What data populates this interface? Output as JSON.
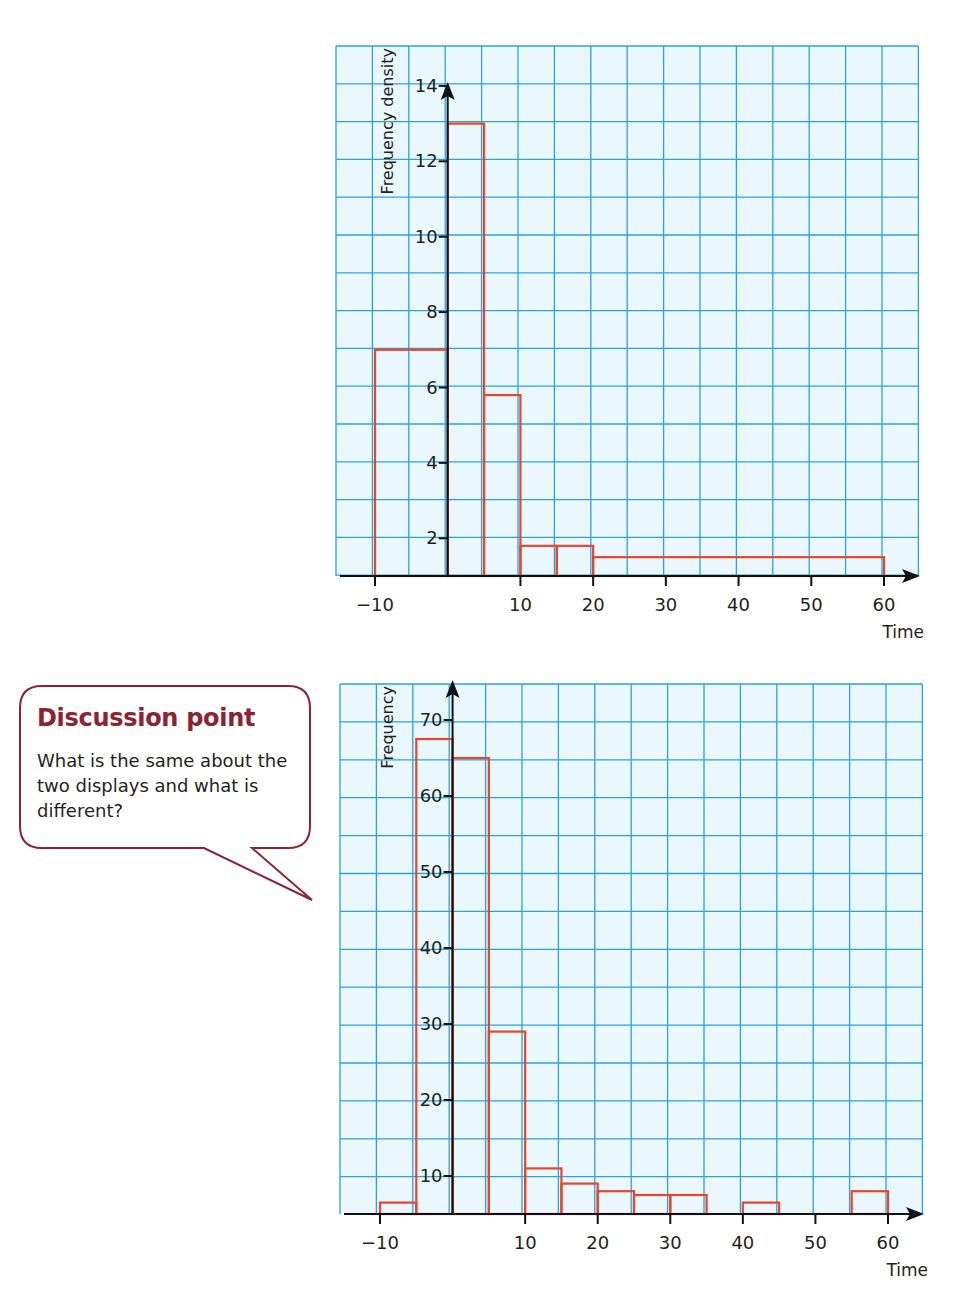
{
  "chart_data": [
    {
      "type": "bar",
      "subtype": "histogram",
      "title": "",
      "xlabel": "Time",
      "ylabel": "Frequency density",
      "xlim": [
        -13,
        64
      ],
      "ylim": [
        1,
        14.5
      ],
      "xticks": [
        -10,
        10,
        20,
        30,
        40,
        50,
        60
      ],
      "yticks": [
        2,
        4,
        6,
        8,
        10,
        12,
        14
      ],
      "grid": true,
      "bins": [
        {
          "from": -10,
          "to": 0,
          "value": 7
        },
        {
          "from": 0,
          "to": 5,
          "value": 13
        },
        {
          "from": 5,
          "to": 10,
          "value": 5.8
        },
        {
          "from": 10,
          "to": 15,
          "value": 1.8
        },
        {
          "from": 15,
          "to": 20,
          "value": 1.8
        },
        {
          "from": 20,
          "to": 60,
          "value": 1.5
        }
      ]
    },
    {
      "type": "bar",
      "subtype": "frequency-chart",
      "title": "",
      "xlabel": "Time",
      "ylabel": "Frequency",
      "xlim": [
        -13,
        64
      ],
      "ylim": [
        5,
        76
      ],
      "xticks": [
        -10,
        10,
        20,
        30,
        40,
        50,
        60
      ],
      "yticks": [
        10,
        20,
        30,
        40,
        50,
        60,
        70
      ],
      "grid": true,
      "bins": [
        {
          "from": -10,
          "to": -5,
          "value": 6.5
        },
        {
          "from": -5,
          "to": 0,
          "value": 67.5
        },
        {
          "from": 0,
          "to": 5,
          "value": 65
        },
        {
          "from": 5,
          "to": 10,
          "value": 29
        },
        {
          "from": 10,
          "to": 15,
          "value": 11
        },
        {
          "from": 15,
          "to": 20,
          "value": 9
        },
        {
          "from": 20,
          "to": 25,
          "value": 8
        },
        {
          "from": 25,
          "to": 30,
          "value": 7.5
        },
        {
          "from": 30,
          "to": 35,
          "value": 7.5
        },
        {
          "from": 40,
          "to": 45,
          "value": 6.5
        },
        {
          "from": 55,
          "to": 60,
          "value": 8
        }
      ]
    }
  ],
  "callout": {
    "title": "Discussion point",
    "text": "What is the same about the two displays and what is different?"
  },
  "colors": {
    "grid": "#29a3dc",
    "grid_bg": "#eaf8fd",
    "bars": "#e8452c",
    "axis": "#111111",
    "callout_border": "#8b2331",
    "callout_title": "#8b2331"
  }
}
